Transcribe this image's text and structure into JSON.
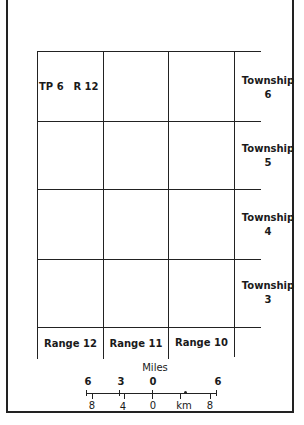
{
  "cells": {
    "top_left": {
      "township": "TP 6",
      "range": "R 12"
    }
  },
  "townships": [
    {
      "label": "Township",
      "number": "6"
    },
    {
      "label": "Township",
      "number": "5"
    },
    {
      "label": "Township",
      "number": "4"
    },
    {
      "label": "Township",
      "number": "3"
    }
  ],
  "ranges": [
    {
      "label": "Range 12"
    },
    {
      "label": "Range 11"
    },
    {
      "label": "Range 10"
    }
  ],
  "scale": {
    "miles_label": "Miles",
    "miles_ticks": [
      "6",
      "3",
      "0",
      "6"
    ],
    "km_label": "km",
    "km_ticks": [
      "8",
      "4",
      "0",
      "8"
    ]
  }
}
